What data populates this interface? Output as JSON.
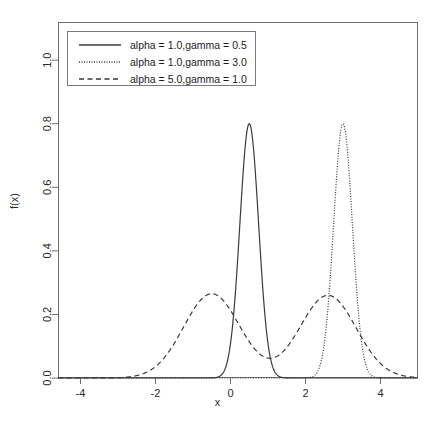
{
  "chart_data": {
    "type": "line",
    "title": "",
    "xlabel": "x",
    "ylabel": "f(x)",
    "xlim": [
      -4.6,
      5.0
    ],
    "ylim": [
      0.0,
      1.12
    ],
    "grid": false,
    "legend_position": "top-left",
    "xticks": [
      -4,
      -2,
      0,
      2,
      4
    ],
    "xtick_labels": [
      "-4",
      "-2",
      "0",
      "2",
      "4"
    ],
    "yticks": [
      0.0,
      0.2,
      0.4,
      0.6,
      0.8,
      1.0
    ],
    "ytick_labels": [
      "0.0",
      "0.2",
      "0.4",
      "0.6",
      "0.8",
      "1.0"
    ],
    "series": [
      {
        "name": "alpha = 1.0,gamma = 0.5",
        "style": "solid",
        "color": "#3a3a3a",
        "peaks": [
          {
            "x": 0.5,
            "y": 0.8
          }
        ],
        "baseline": 0.0,
        "width": 0.5
      },
      {
        "name": "alpha = 1.0,gamma = 3.0",
        "style": "dotted",
        "color": "#3a3a3a",
        "peaks": [
          {
            "x": 3.0,
            "y": 0.8
          }
        ],
        "baseline": 0.0,
        "width": 0.5
      },
      {
        "name": "alpha = 5.0,gamma = 1.0",
        "style": "dashed",
        "color": "#3a3a3a",
        "peaks": [
          {
            "x": -0.5,
            "y": 0.265
          },
          {
            "x": 2.6,
            "y": 0.26
          }
        ],
        "valley": {
          "x": 1.3,
          "y": 0.185
        },
        "baseline": 0.0,
        "width": 1.5
      }
    ]
  },
  "legend": {
    "entries": [
      {
        "label": "alpha = 1.0,gamma = 0.5",
        "style": "solid"
      },
      {
        "label": "alpha = 1.0,gamma = 3.0",
        "style": "dotted"
      },
      {
        "label": "alpha = 5.0,gamma = 1.0",
        "style": "dashed"
      }
    ]
  },
  "axes": {
    "x_title": "x",
    "y_title": "f(x)"
  }
}
